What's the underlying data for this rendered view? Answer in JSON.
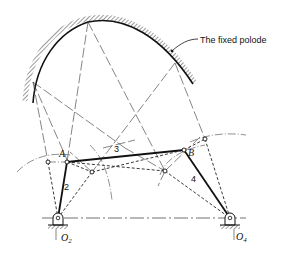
{
  "figure": {
    "annotation": "The fixed polode",
    "points": {
      "A": "A",
      "B": "B",
      "O2_base": "O",
      "O2_sub": "2",
      "O4_base": "O",
      "O4_sub": "4"
    },
    "links": {
      "link2": "2",
      "link3": "3",
      "link4": "4"
    }
  }
}
